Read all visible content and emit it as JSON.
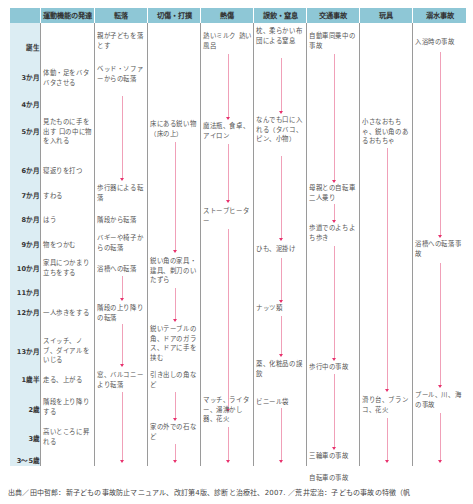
{
  "headers": [
    "",
    "運動機能の発達",
    "転落",
    "切傷・打撲",
    "熱傷",
    "誤飲・窒息",
    "交通事故",
    "玩具",
    "溺水事故"
  ],
  "ages": [
    "誕生",
    "3か月",
    "4か月",
    "5か月",
    "6か月",
    "7か月",
    "8か月",
    "9か月",
    "10か月",
    "11か月",
    "12か月",
    "13か月",
    "1歳半",
    "2歳",
    "3歳",
    "3～5歳"
  ],
  "motor": {
    "birth": "",
    "m3": "体動・足をバタバタさせる",
    "m5": "見たものに手を出す 口の中に物を入れる",
    "m6": "寝返りを打つ",
    "m7": "すわる",
    "m8": "はう",
    "m9": "物をつかむ",
    "m10": "家具につかまり立ちをする",
    "m12": "一人歩きをする",
    "m13": "スイッチ、ノブ、ダイアルをいじる",
    "y15": "走る、上がる",
    "y2": "階段を上り降りする",
    "y3": "高いところに昇れる"
  },
  "falls": {
    "birth": "親が子どもを落とす",
    "m3": "ベッド・ソファーからの転落",
    "m7": "歩行器による転落",
    "m8": "階段から転落",
    "m9": "バギーや椅子からの転落",
    "m10": "浴槽への転落",
    "m12": "階段の上り降りの転落",
    "y15": "窓、バルコニーより転落"
  },
  "cuts": {
    "m5": "床にある鋭い物（床の上）",
    "m10": "鋭い角の家具・建具、剃刀のいたずら",
    "m13": "鋭いテーブルの角、ドアのガラス、ドアに手を挟む",
    "y15": "引き出しの角など",
    "y3": "家の外での石など"
  },
  "burns": {
    "birth": "熱いミルク 熱い風呂",
    "m5": "魔法瓶、食卓、アイロン",
    "m8": "ストーブヒーター",
    "y2": "マッチ、ライター、湯沸かし器、花火"
  },
  "choking": {
    "birth": "枕、柔らかい布団による窒息",
    "m5": "なんでも口に入れる（タバコ、ピン、小物）",
    "m9": "ひも、泥掛け",
    "m11": "ナッツ類",
    "m13": "薬、化粧品の誤飲",
    "y15": "ビニール袋"
  },
  "traffic": {
    "birth": "自動車同乗中の事故",
    "m6": "母親との自転車二人乗り",
    "m8": "歩道でのよちよち歩き",
    "m13": "歩行中の事故",
    "y3": "三輪車の事故",
    "y35": "自転車の事故"
  },
  "toys": {
    "m5": "小さなおもちゃ、鋭い角のあるおもちゃ",
    "y2": "滑り台、ブランコ、花火"
  },
  "drowning": {
    "birth": "入浴時の事故",
    "m9": "浴槽への転落事故",
    "y2": "プール、川、海の事故"
  },
  "footer": "出典／田中哲郎：新子どもの事故防止マニュアル、改訂第4版、診断と治療社、2007. ／荒井宏治：子どもの事故の特徴（帆",
  "colors": {
    "header": "#8ec7d6",
    "age_col": "#dcedf3",
    "arrow": "#e8336e"
  }
}
